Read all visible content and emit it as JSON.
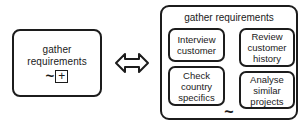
{
  "diagram": {
    "type": "bpmn-subprocess-equivalence",
    "collapsed": {
      "label": "gather\nrequirements",
      "markers": {
        "adhoc_symbol": "~",
        "collapsed_symbol": "+"
      }
    },
    "relation": {
      "symbol": "⇔",
      "name": "double-headed-arrow"
    },
    "expanded": {
      "title": "gather requirements",
      "adhoc_symbol": "~",
      "tasks": [
        {
          "name": "interview-customer",
          "label": "Interview\ncustomer"
        },
        {
          "name": "review-customer-history",
          "label": "Review\ncustomer\nhistory"
        },
        {
          "name": "check-country-specifics",
          "label": "Check\ncountry\nspecifics"
        },
        {
          "name": "analyse-similar-projects",
          "label": "Analyse\nsimilar\nprojects"
        }
      ]
    },
    "colors": {
      "stroke": "#1c1c1c",
      "fill": "#ffffff",
      "text": "#1a1a1a"
    }
  }
}
